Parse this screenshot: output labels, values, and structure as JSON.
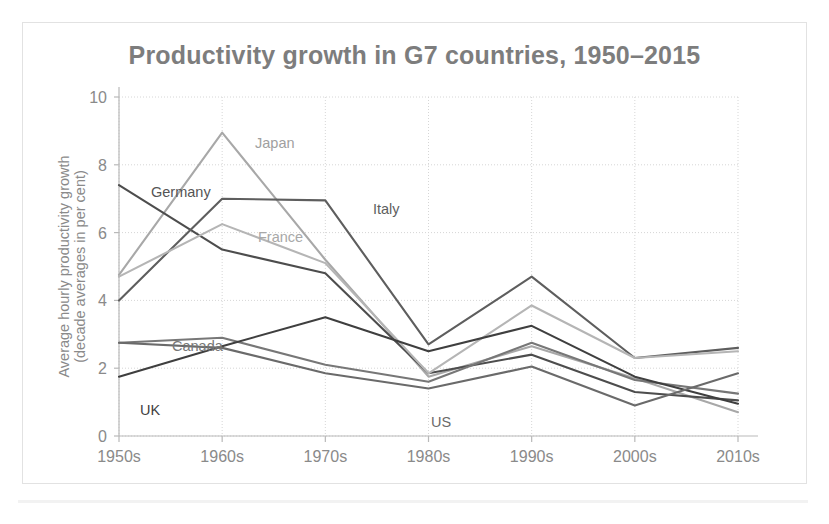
{
  "figure": {
    "title": "Productivity growth in G7 countries, 1950–2015",
    "title_color": "#7d7d7d",
    "background_color": "#ffffff",
    "border_color": "#e2e2e2"
  },
  "axes": {
    "ylabel_line1": "Average hourly productivity growth",
    "ylabel_line2": "(decade averages in per cent)",
    "ytick_labels": [
      "0",
      "2",
      "4",
      "6",
      "8",
      "10"
    ],
    "xtick_labels": [
      "1950s",
      "1960s",
      "1970s",
      "1980s",
      "1990s",
      "2000s",
      "2010s"
    ],
    "tick_color": "#8a8a8a",
    "grid_color": "#d6d6d6"
  },
  "chart_data": {
    "type": "line",
    "title": "Productivity growth in G7 countries, 1950–2015",
    "xlabel": "",
    "ylabel": "Average hourly productivity growth (decade averages in per cent)",
    "categories": [
      "1950s",
      "1960s",
      "1970s",
      "1980s",
      "1990s",
      "2000s",
      "2010s"
    ],
    "ylim": [
      0,
      10
    ],
    "yticks": [
      0,
      2,
      4,
      6,
      8,
      10
    ],
    "grid": true,
    "legend": "inline-labels",
    "series": [
      {
        "name": "Japan",
        "color": "#a8a8a8",
        "label_x_index": 1,
        "values": [
          4.75,
          8.95,
          5.2,
          1.75,
          2.65,
          1.7,
          0.7
        ]
      },
      {
        "name": "Germany",
        "color": "#4d4d4d",
        "label_x_index": 0,
        "values": [
          7.4,
          5.5,
          4.8,
          1.85,
          2.4,
          1.3,
          1.05
        ]
      },
      {
        "name": "Italy",
        "color": "#5e5e5e",
        "label_x_index": 2,
        "values": [
          4.0,
          7.0,
          6.95,
          2.7,
          4.7,
          2.3,
          2.6
        ]
      },
      {
        "name": "France",
        "color": "#b5b5b5",
        "label_x_index": 2,
        "values": [
          4.7,
          6.25,
          5.1,
          1.85,
          3.85,
          2.3,
          2.5
        ]
      },
      {
        "name": "Canada",
        "color": "#777777",
        "label_x_index": 0,
        "values": [
          2.75,
          2.9,
          2.1,
          1.6,
          2.75,
          1.65,
          1.25
        ]
      },
      {
        "name": "UK",
        "color": "#3f3f3f",
        "label_x_index": 0,
        "values": [
          1.75,
          2.65,
          3.5,
          2.5,
          3.25,
          1.75,
          0.95
        ]
      },
      {
        "name": "US",
        "color": "#6a6a6a",
        "label_x_index": 3,
        "values": [
          2.75,
          2.6,
          1.85,
          1.4,
          2.05,
          0.9,
          1.85
        ]
      }
    ]
  },
  "series_labels": [
    {
      "name": "Japan",
      "text": "Japan",
      "x": 232,
      "y": 125,
      "color": "#a0a0a0"
    },
    {
      "name": "Germany",
      "text": "Germany",
      "x": 128,
      "y": 174,
      "color": "#555555"
    },
    {
      "name": "Italy",
      "text": "Italy",
      "x": 350,
      "y": 191,
      "color": "#5e5e5e"
    },
    {
      "name": "France",
      "text": "France",
      "x": 235,
      "y": 219,
      "color": "#a8a8a8"
    },
    {
      "name": "Canada",
      "text": "Canada",
      "x": 149,
      "y": 328,
      "color": "#777777"
    },
    {
      "name": "UK",
      "text": "UK",
      "x": 117,
      "y": 392,
      "color": "#3f3f3f"
    },
    {
      "name": "US",
      "text": "US",
      "x": 408,
      "y": 404,
      "color": "#6a6a6a"
    }
  ]
}
